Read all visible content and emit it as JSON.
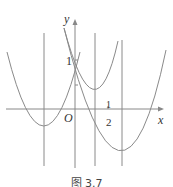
{
  "figure": {
    "caption": "图 3.7",
    "axes": {
      "x_label": "x",
      "y_label": "y",
      "origin_label": "O",
      "y_tick_label": "1",
      "x_tick_num": "1",
      "x_tick_den": "2"
    },
    "colors": {
      "curve": "#8a8a8a",
      "axis": "#888888",
      "text": "#333333"
    }
  }
}
